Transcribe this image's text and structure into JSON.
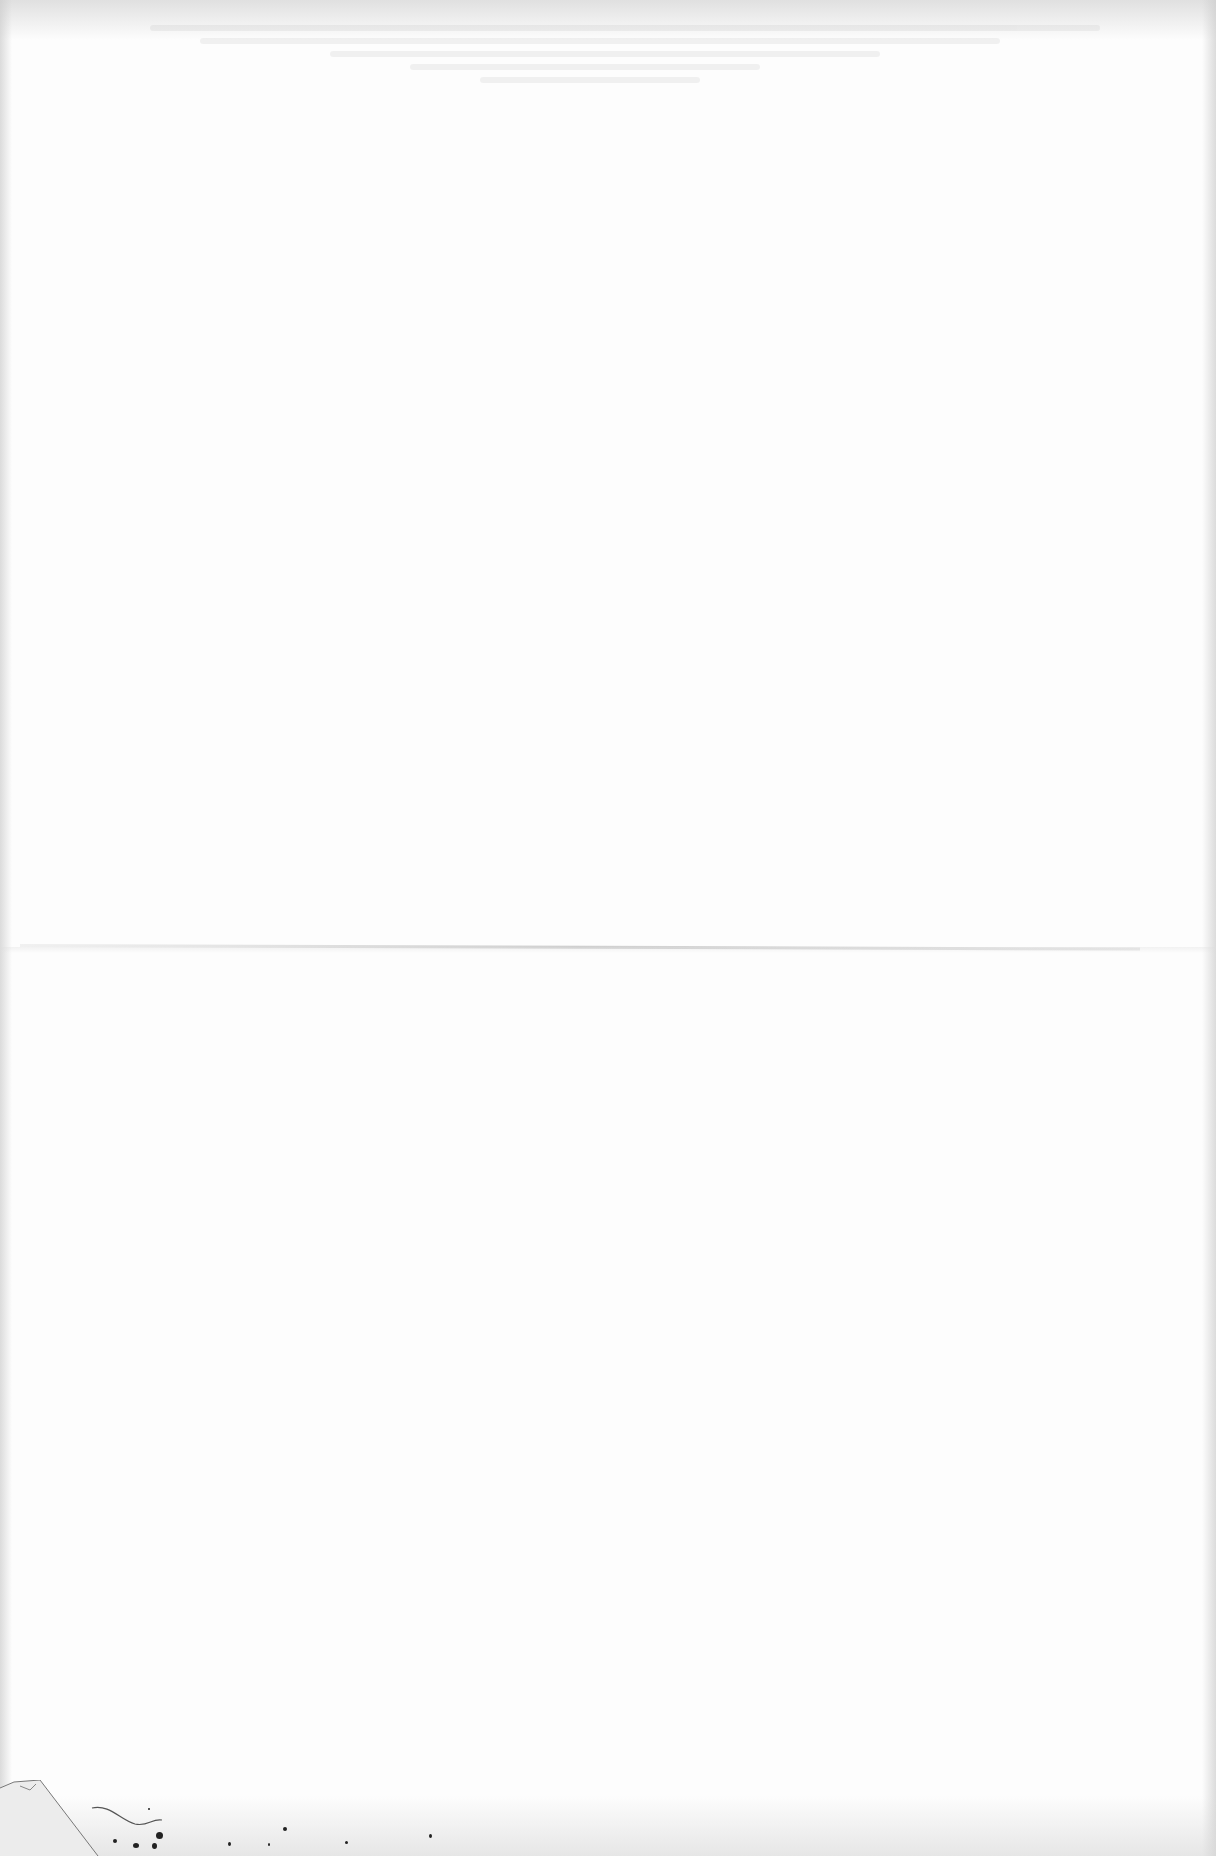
{
  "document": {
    "type": "blank-scanned-page",
    "text_content": "",
    "background_color": "#fdfdfd",
    "features": {
      "fold_line": {
        "orientation": "horizontal",
        "y": 946
      },
      "bleed_through": {
        "region": "top",
        "legible": false
      },
      "debris": {
        "region": "bottom-left",
        "items": [
          "torn-corner",
          "hair-strand",
          "ink-specks"
        ]
      }
    }
  }
}
